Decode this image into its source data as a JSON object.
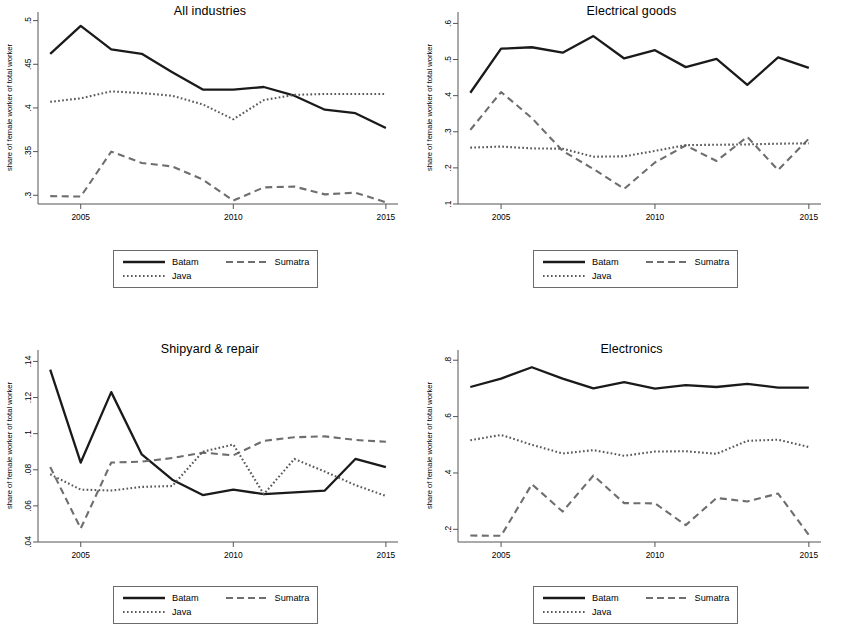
{
  "figure": {
    "panels_order": [
      "all_industries",
      "electrical_goods",
      "shipyard_repair",
      "electronics"
    ],
    "legend": {
      "batam_label": "Batam",
      "sumatra_label": "Sumatra",
      "java_label": "Java"
    },
    "axis": {
      "ylabel": "share of female worker of total worker",
      "xticks": [
        "2005",
        "2010",
        "2015"
      ]
    },
    "colors": {
      "batam": "#1a1a1a",
      "sumatra": "#6e6e6e",
      "java": "#5a5a5a",
      "axis": "#555555",
      "background": "#ffffff"
    }
  },
  "chart_data": [
    {
      "id": "all_industries",
      "type": "line",
      "title": "All industries",
      "xlabel": "",
      "ylabel": "share of female worker of total worker",
      "x": [
        2004,
        2005,
        2006,
        2007,
        2008,
        2009,
        2010,
        2011,
        2012,
        2013,
        2014,
        2015
      ],
      "xlim": [
        2003.6,
        2015.2
      ],
      "ylim": [
        0.29,
        0.503
      ],
      "yticks": [
        0.3,
        0.35,
        0.4,
        0.45,
        0.5
      ],
      "ytick_labels": [
        ".3",
        ".35",
        ".4",
        ".45",
        ".5"
      ],
      "xticks": [
        2005,
        2010,
        2015
      ],
      "xtick_labels": [
        "2005",
        "2010",
        "2015"
      ],
      "grid": false,
      "legend_position": "bottom-center",
      "series": [
        {
          "name": "Batam",
          "style": "solid",
          "values": [
            0.462,
            0.494,
            0.467,
            0.462,
            0.441,
            0.421,
            0.421,
            0.424,
            0.414,
            0.398,
            0.394,
            0.377
          ]
        },
        {
          "name": "Sumatra",
          "style": "dashed",
          "values": [
            0.299,
            0.2985,
            0.35,
            0.337,
            0.333,
            0.318,
            0.294,
            0.309,
            0.31,
            0.301,
            0.303,
            0.292
          ]
        },
        {
          "name": "Java",
          "style": "dotted",
          "values": [
            0.407,
            0.411,
            0.419,
            0.417,
            0.414,
            0.404,
            0.387,
            0.409,
            0.415,
            0.416,
            0.416,
            0.416
          ]
        }
      ]
    },
    {
      "id": "electrical_goods",
      "type": "line",
      "title": "Electrical goods",
      "xlabel": "",
      "ylabel": "share of female worker of total worker",
      "x": [
        2004,
        2005,
        2006,
        2007,
        2008,
        2009,
        2010,
        2011,
        2012,
        2013,
        2014,
        2015
      ],
      "xlim": [
        2003.6,
        2015.2
      ],
      "ylim": [
        0.1,
        0.615
      ],
      "yticks": [
        0.1,
        0.2,
        0.3,
        0.4,
        0.5,
        0.6
      ],
      "ytick_labels": [
        ".1",
        ".2",
        ".3",
        ".4",
        ".5",
        ".6"
      ],
      "xticks": [
        2005,
        2010,
        2015
      ],
      "xtick_labels": [
        "2005",
        "2010",
        "2015"
      ],
      "grid": false,
      "legend_position": "bottom-center",
      "series": [
        {
          "name": "Batam",
          "style": "solid",
          "values": [
            0.408,
            0.53,
            0.534,
            0.519,
            0.565,
            0.503,
            0.526,
            0.479,
            0.502,
            0.43,
            0.506,
            0.477
          ]
        },
        {
          "name": "Sumatra",
          "style": "dashed",
          "values": [
            0.305,
            0.41,
            0.338,
            0.247,
            0.197,
            0.142,
            0.215,
            0.262,
            0.219,
            0.286,
            0.194,
            0.281
          ]
        },
        {
          "name": "Java",
          "style": "dotted",
          "values": [
            0.256,
            0.259,
            0.254,
            0.253,
            0.231,
            0.232,
            0.247,
            0.263,
            0.264,
            0.265,
            0.267,
            0.268
          ]
        }
      ]
    },
    {
      "id": "shipyard_repair",
      "type": "line",
      "title": "Shipyard & repair",
      "xlabel": "",
      "ylabel": "share of female worker of total worker",
      "x": [
        2004,
        2005,
        2006,
        2007,
        2008,
        2009,
        2010,
        2011,
        2012,
        2013,
        2014,
        2015
      ],
      "xlim": [
        2003.6,
        2015.2
      ],
      "ylim": [
        0.04,
        0.143
      ],
      "yticks": [
        0.04,
        0.06,
        0.08,
        0.1,
        0.12,
        0.14
      ],
      "ytick_labels": [
        ".04",
        ".06",
        ".08",
        ".1",
        ".12",
        ".14"
      ],
      "xticks": [
        2005,
        2010,
        2015
      ],
      "xtick_labels": [
        "2005",
        "2010",
        "2015"
      ],
      "grid": false,
      "legend_position": "bottom-center",
      "series": [
        {
          "name": "Batam",
          "style": "solid",
          "values": [
            0.1355,
            0.084,
            0.123,
            0.0885,
            0.0745,
            0.066,
            0.069,
            0.0665,
            0.0675,
            0.0685,
            0.086,
            0.0815
          ]
        },
        {
          "name": "Sumatra",
          "style": "dashed",
          "values": [
            0.0815,
            0.0475,
            0.084,
            0.0845,
            0.0865,
            0.0895,
            0.088,
            0.096,
            0.098,
            0.0985,
            0.0965,
            0.0955
          ]
        },
        {
          "name": "Java",
          "style": "dotted",
          "values": [
            0.0775,
            0.069,
            0.0685,
            0.0705,
            0.071,
            0.09,
            0.094,
            0.0665,
            0.086,
            0.079,
            0.0715,
            0.0655
          ]
        }
      ]
    },
    {
      "id": "electronics",
      "type": "line",
      "title": "Electronics",
      "xlabel": "",
      "ylabel": "share of female worker of total worker",
      "x": [
        2004,
        2005,
        2006,
        2007,
        2008,
        2009,
        2010,
        2011,
        2012,
        2013,
        2014,
        2015
      ],
      "xlim": [
        2003.6,
        2015.2
      ],
      "ylim": [
        0.155,
        0.815
      ],
      "yticks": [
        0.2,
        0.4,
        0.6,
        0.8
      ],
      "ytick_labels": [
        ".2",
        ".4",
        ".6",
        ".8"
      ],
      "xticks": [
        2005,
        2010,
        2015
      ],
      "xtick_labels": [
        "2005",
        "2010",
        "2015"
      ],
      "grid": false,
      "legend_position": "bottom-center",
      "series": [
        {
          "name": "Batam",
          "style": "solid",
          "values": [
            0.705,
            0.735,
            0.775,
            0.735,
            0.7,
            0.722,
            0.699,
            0.712,
            0.705,
            0.716,
            0.703,
            0.703
          ]
        },
        {
          "name": "Sumatra",
          "style": "dashed",
          "values": [
            0.178,
            0.177,
            0.36,
            0.263,
            0.391,
            0.293,
            0.292,
            0.215,
            0.311,
            0.299,
            0.327,
            0.18
          ]
        },
        {
          "name": "Java",
          "style": "dotted",
          "values": [
            0.516,
            0.535,
            0.5,
            0.469,
            0.481,
            0.461,
            0.476,
            0.477,
            0.468,
            0.514,
            0.518,
            0.492
          ]
        }
      ]
    }
  ]
}
